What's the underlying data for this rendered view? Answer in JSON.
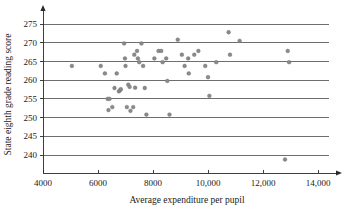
{
  "chart_data": {
    "type": "scatter",
    "title": "",
    "xlabel": "Average expenditure per pupil",
    "ylabel": "State eighth grade reading score",
    "xlim": [
      4000,
      14600
    ],
    "ylim": [
      237,
      277
    ],
    "grid": true,
    "grid_orientation": "horizontal",
    "legend": "none",
    "xticks": [
      4000,
      6000,
      8000,
      10000,
      12000,
      14000
    ],
    "xtick_labels": [
      "4000",
      "6000",
      "8000",
      "10,000",
      "12,000",
      "14,000"
    ],
    "yticks": [
      240,
      245,
      250,
      255,
      260,
      265,
      270,
      275
    ],
    "ytick_labels": [
      "240",
      "245",
      "250",
      "255",
      "260",
      "265",
      "270",
      "275"
    ],
    "marker": "circle",
    "marker_color": "#8a8a8a",
    "points": [
      {
        "x": 5050,
        "y": 263.8
      },
      {
        "x": 6100,
        "y": 263.8
      },
      {
        "x": 6250,
        "y": 261.8
      },
      {
        "x": 6350,
        "y": 255.0
      },
      {
        "x": 6420,
        "y": 255.0
      },
      {
        "x": 6380,
        "y": 252.0
      },
      {
        "x": 6520,
        "y": 252.8
      },
      {
        "x": 6600,
        "y": 257.9
      },
      {
        "x": 6680,
        "y": 261.8
      },
      {
        "x": 6760,
        "y": 257.0
      },
      {
        "x": 6800,
        "y": 257.3
      },
      {
        "x": 6830,
        "y": 257.6
      },
      {
        "x": 6950,
        "y": 269.8
      },
      {
        "x": 6980,
        "y": 265.8
      },
      {
        "x": 7000,
        "y": 263.8
      },
      {
        "x": 7050,
        "y": 252.8
      },
      {
        "x": 7100,
        "y": 258.8
      },
      {
        "x": 7150,
        "y": 258.2
      },
      {
        "x": 7180,
        "y": 251.8
      },
      {
        "x": 7280,
        "y": 252.8
      },
      {
        "x": 7320,
        "y": 266.8
      },
      {
        "x": 7350,
        "y": 258.0
      },
      {
        "x": 7420,
        "y": 267.8
      },
      {
        "x": 7450,
        "y": 265.8
      },
      {
        "x": 7500,
        "y": 264.8
      },
      {
        "x": 7580,
        "y": 269.8
      },
      {
        "x": 7640,
        "y": 263.8
      },
      {
        "x": 7700,
        "y": 257.9
      },
      {
        "x": 7760,
        "y": 250.8
      },
      {
        "x": 8050,
        "y": 265.8
      },
      {
        "x": 8200,
        "y": 267.8
      },
      {
        "x": 8300,
        "y": 267.8
      },
      {
        "x": 8350,
        "y": 264.8
      },
      {
        "x": 8480,
        "y": 265.8
      },
      {
        "x": 8520,
        "y": 259.8
      },
      {
        "x": 8600,
        "y": 250.8
      },
      {
        "x": 8900,
        "y": 270.8
      },
      {
        "x": 9050,
        "y": 266.8
      },
      {
        "x": 9150,
        "y": 263.8
      },
      {
        "x": 9280,
        "y": 265.8
      },
      {
        "x": 9300,
        "y": 261.8
      },
      {
        "x": 9500,
        "y": 266.8
      },
      {
        "x": 9650,
        "y": 267.8
      },
      {
        "x": 9900,
        "y": 263.8
      },
      {
        "x": 10000,
        "y": 260.8
      },
      {
        "x": 10050,
        "y": 255.8
      },
      {
        "x": 10300,
        "y": 264.8
      },
      {
        "x": 10750,
        "y": 272.8
      },
      {
        "x": 10800,
        "y": 266.8
      },
      {
        "x": 11150,
        "y": 270.5
      },
      {
        "x": 12900,
        "y": 267.8
      },
      {
        "x": 12950,
        "y": 264.8
      },
      {
        "x": 12800,
        "y": 238.8
      }
    ]
  }
}
